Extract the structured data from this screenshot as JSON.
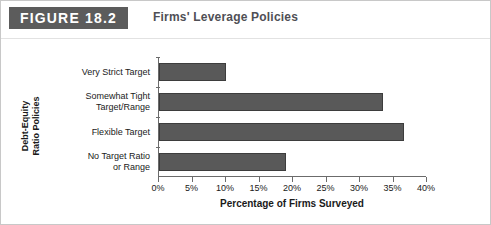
{
  "figure": {
    "badge_label": "FIGURE 18.2",
    "title": "Firms' Leverage Policies"
  },
  "colors": {
    "badge_background": "#5c5c5c",
    "badge_text": "#ffffff",
    "title_text": "#4f4f55",
    "bar_fill": "#595959",
    "bar_border": "#3d3d3d",
    "axis_line": "#6b6b6b",
    "figure_border": "#c8c8c8"
  },
  "chart_data": {
    "type": "bar",
    "orientation": "horizontal",
    "title": "Firms' Leverage Policies",
    "categories": [
      "Very Strict Target",
      "Somewhat Tight Target/Range",
      "Flexible Target",
      "No Target Ratio or Range"
    ],
    "category_lines": [
      [
        "Very Strict Target"
      ],
      [
        "Somewhat Tight",
        "Target/Range"
      ],
      [
        "Flexible Target"
      ],
      [
        "No Target Ratio",
        "or Range"
      ]
    ],
    "values": [
      10,
      33.5,
      36.5,
      19
    ],
    "xlabel": "Percentage of Firms Surveyed",
    "ylabel": "Debt-Equity Ratio Policies",
    "ylabel_lines": [
      "Debt-Equity",
      "Ratio Policies"
    ],
    "xlim": [
      0,
      40
    ],
    "xticks": [
      0,
      5,
      10,
      15,
      20,
      25,
      30,
      35,
      40
    ],
    "xtick_labels": [
      "0%",
      "5%",
      "10%",
      "15%",
      "20%",
      "25%",
      "30%",
      "35%",
      "40%"
    ],
    "grid": false,
    "legend": false
  }
}
